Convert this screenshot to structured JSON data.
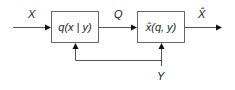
{
  "diagram": {
    "blocks": [
      {
        "id": "encoder",
        "label": "q(x | y)"
      },
      {
        "id": "decoder",
        "label": "x̂(q, y)"
      }
    ],
    "signals": {
      "input": "X",
      "intermediate": "Q",
      "output": "X̂",
      "side_info": "Y"
    },
    "colors": {
      "stroke": "#555555",
      "box_border": "#666666",
      "arrow": "#111111",
      "text": "#222222"
    }
  }
}
